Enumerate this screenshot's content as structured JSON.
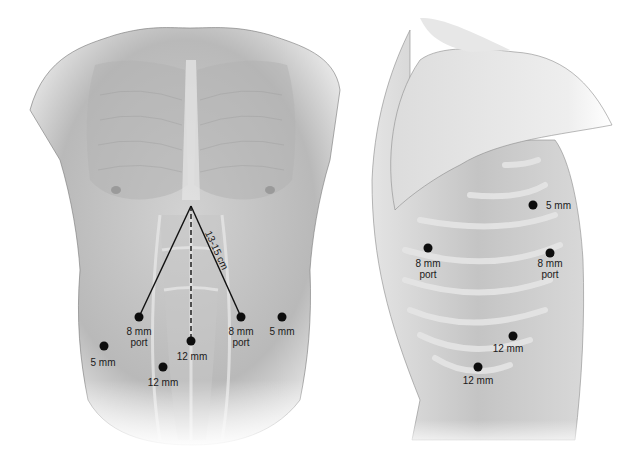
{
  "figure": {
    "colors": {
      "port_dot": "#0d0d0d",
      "line": "#111111",
      "skin_dark": "#a9a9a9",
      "skin_light": "#e6e6e6"
    }
  },
  "anterior_view": {
    "measurement_label": "13-15 cm",
    "ports": [
      {
        "id": "left-8mm",
        "size": "8 mm",
        "type": "port",
        "x": 139,
        "y": 317
      },
      {
        "id": "right-8mm",
        "size": "8 mm",
        "type": "port",
        "x": 241,
        "y": 317
      },
      {
        "id": "center-12mm",
        "size": "12 mm",
        "type": "",
        "x": 191,
        "y": 341
      },
      {
        "id": "right-5mm",
        "size": "5 mm",
        "type": "",
        "x": 282,
        "y": 317
      },
      {
        "id": "left-5mm",
        "size": "5 mm",
        "type": "",
        "x": 104,
        "y": 346
      },
      {
        "id": "lower-12mm",
        "size": "12 mm",
        "type": "",
        "x": 163,
        "y": 367
      }
    ]
  },
  "lateral_view": {
    "ports": [
      {
        "id": "upper-5mm",
        "size": "5 mm",
        "type": "",
        "x": 533,
        "y": 205
      },
      {
        "id": "anterior-8mm",
        "size": "8 mm",
        "type": "port",
        "x": 428,
        "y": 248
      },
      {
        "id": "posterior-8mm",
        "size": "8 mm",
        "type": "port",
        "x": 550,
        "y": 253
      },
      {
        "id": "upper-12mm",
        "size": "12 mm",
        "type": "",
        "x": 513,
        "y": 336
      },
      {
        "id": "lower-12mm",
        "size": "12 mm",
        "type": "",
        "x": 478,
        "y": 367
      }
    ]
  }
}
